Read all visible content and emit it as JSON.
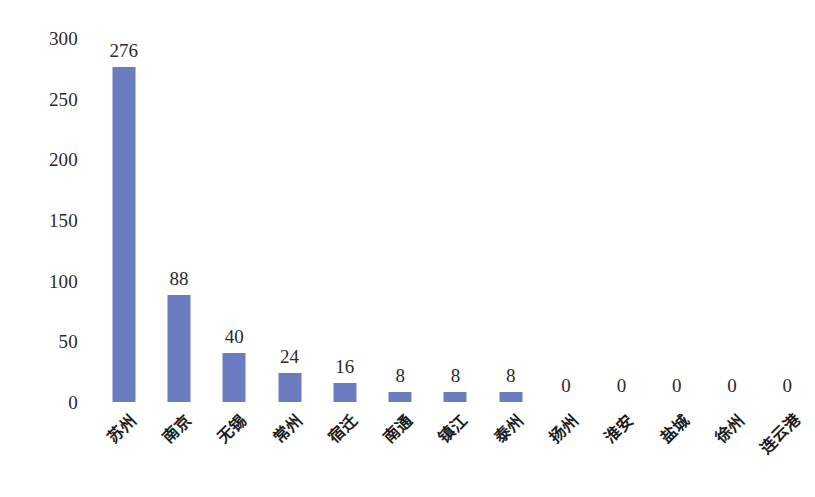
{
  "chart_data": {
    "type": "bar",
    "title": "",
    "subtitle": "",
    "xlabel": "",
    "ylabel": "",
    "categories": [
      "苏州",
      "南京",
      "无锡",
      "常州",
      "宿迁",
      "南通",
      "镇江",
      "泰州",
      "扬州",
      "淮安",
      "盐城",
      "徐州",
      "连云港"
    ],
    "values": [
      276,
      88,
      40,
      24,
      16,
      8,
      8,
      8,
      0,
      0,
      0,
      0,
      0
    ],
    "data_labels": [
      "276",
      "88",
      "40",
      "24",
      "16",
      "8",
      "8",
      "8",
      "0",
      "0",
      "0",
      "0",
      "0"
    ],
    "ylim": [
      0,
      300
    ],
    "ytick_values": [
      0,
      50,
      100,
      150,
      200,
      250,
      300
    ],
    "ytick_labels": [
      "0",
      "50",
      "100",
      "150",
      "200",
      "250",
      "300"
    ],
    "grid": false,
    "legend": null,
    "legend_position": "none",
    "axis_lines": false,
    "bar_color": "#6b7cc0",
    "text_color": "#2b2b2b",
    "background_color": "#ffffff",
    "label_rotation_degrees": -45
  }
}
